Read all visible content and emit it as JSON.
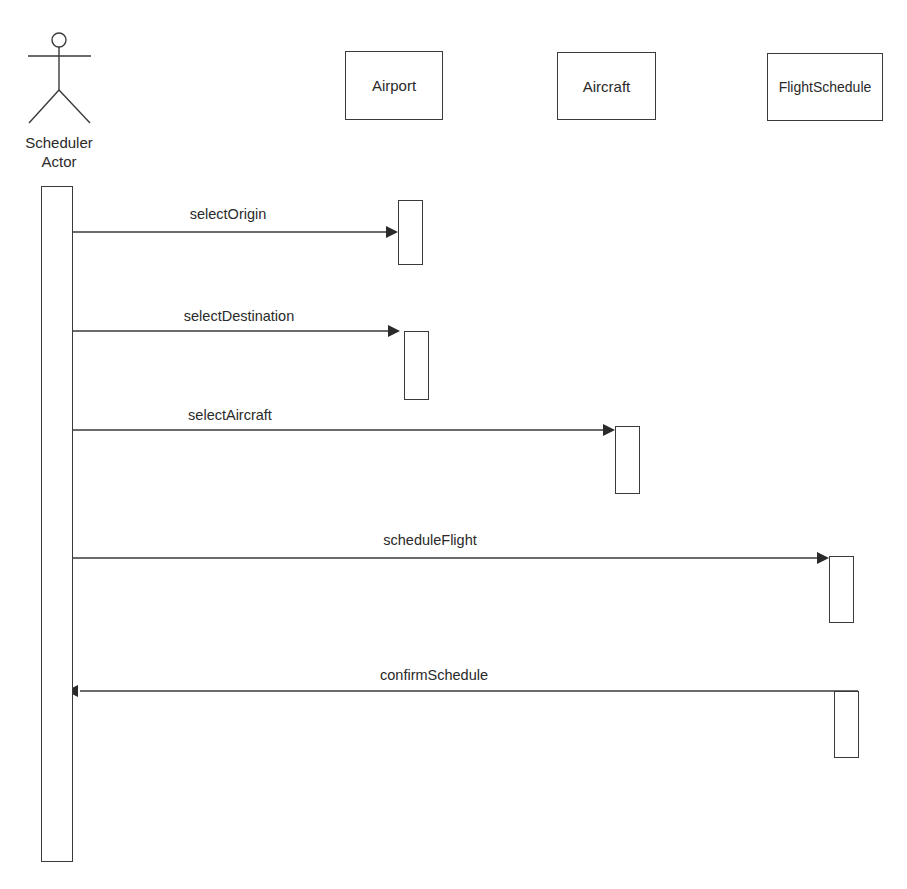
{
  "diagram": {
    "type": "sequence",
    "actor": {
      "label_line1": "Scheduler",
      "label_line2": "Actor"
    },
    "participants": [
      {
        "id": "airport",
        "label": "Airport"
      },
      {
        "id": "aircraft",
        "label": "Aircraft"
      },
      {
        "id": "flightschedule",
        "label": "FlightSchedule"
      }
    ],
    "messages": [
      {
        "label": "selectOrigin",
        "from": "Scheduler Actor",
        "to": "Airport",
        "direction": "request"
      },
      {
        "label": "selectDestination",
        "from": "Scheduler Actor",
        "to": "Airport",
        "direction": "request"
      },
      {
        "label": "selectAircraft",
        "from": "Scheduler Actor",
        "to": "Aircraft",
        "direction": "request"
      },
      {
        "label": "scheduleFlight",
        "from": "Scheduler Actor",
        "to": "FlightSchedule",
        "direction": "request"
      },
      {
        "label": "confirmSchedule",
        "from": "FlightSchedule",
        "to": "Scheduler Actor",
        "direction": "return"
      }
    ],
    "colors": {
      "line": "#3a3a3a",
      "text": "#2a2a2a",
      "background": "#ffffff"
    }
  }
}
